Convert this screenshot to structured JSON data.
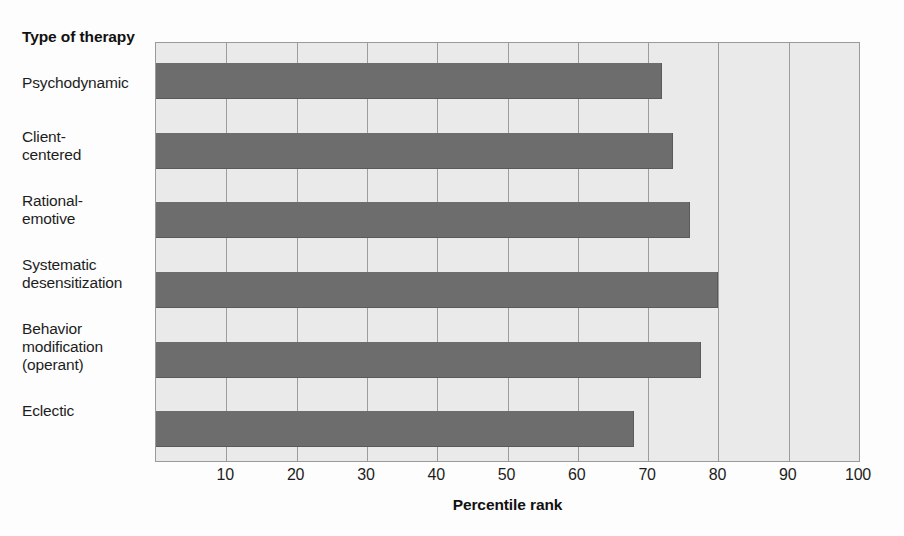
{
  "figure": {
    "category_axis_title": "Type of\ntherapy",
    "background_color": "#fdfdfd",
    "plot_background_color": "#eaeaea",
    "bar_color": "#6d6d6d",
    "gridline_color": "#9d9d9d"
  },
  "chart_data": {
    "type": "bar",
    "orientation": "horizontal",
    "title": "",
    "xlabel": "Percentile rank",
    "ylabel": "Type of therapy",
    "xlim": [
      0,
      100
    ],
    "xticks": [
      10,
      20,
      30,
      40,
      50,
      60,
      70,
      80,
      90,
      100
    ],
    "xtick_labels": [
      "10",
      "20",
      "30",
      "40",
      "50",
      "60",
      "70",
      "80",
      "90",
      "100"
    ],
    "grid": true,
    "legend": false,
    "categories": [
      "Psychodynamic",
      "Client-\ncentered",
      "Rational-\nemotive",
      "Systematic\ndesensitization",
      "Behavior\nmodification\n(operant)",
      "Eclectic"
    ],
    "values": [
      72,
      73.5,
      76,
      80,
      77.5,
      68
    ]
  }
}
